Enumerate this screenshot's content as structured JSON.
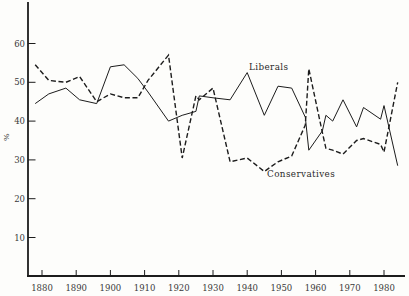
{
  "figure": {
    "background": "#fdfdfb",
    "line_color": "#1c1c1c",
    "text_color": "#3a3a3a"
  },
  "labels": {
    "y_unit": "%",
    "liberals": "Liberals",
    "conservatives": "Conservatives"
  },
  "chart_data": {
    "type": "line",
    "title": "",
    "xlabel": "",
    "ylabel": "%",
    "grid": false,
    "legend": "inline-annotations",
    "xlim": [
      1876,
      1986
    ],
    "ylim": [
      0,
      63
    ],
    "x_ticks": [
      1880,
      1890,
      1900,
      1910,
      1920,
      1930,
      1940,
      1950,
      1960,
      1970,
      1980
    ],
    "y_ticks": [
      10,
      20,
      30,
      40,
      50,
      60
    ],
    "series": [
      {
        "name": "Liberals",
        "style": "solid",
        "x": [
          1878,
          1882,
          1887,
          1891,
          1896,
          1900,
          1904,
          1908,
          1911,
          1917,
          1921,
          1925,
          1926,
          1930,
          1935,
          1940,
          1945,
          1949,
          1953,
          1957,
          1958,
          1962,
          1963,
          1965,
          1968,
          1972,
          1974,
          1979,
          1980,
          1984
        ],
        "values": [
          44.5,
          47,
          48.5,
          45.5,
          44.5,
          54,
          54.5,
          51,
          47.5,
          40,
          41.5,
          42.5,
          46.5,
          46,
          45.5,
          52.5,
          41.5,
          49,
          48.5,
          41,
          32.5,
          37.5,
          41.5,
          40,
          45.5,
          38.5,
          43.5,
          40.5,
          44,
          28.5
        ]
      },
      {
        "name": "Conservatives",
        "style": "dashed",
        "x": [
          1878,
          1882,
          1887,
          1891,
          1896,
          1900,
          1904,
          1908,
          1911,
          1917,
          1921,
          1925,
          1926,
          1930,
          1935,
          1940,
          1945,
          1949,
          1953,
          1957,
          1958,
          1962,
          1963,
          1965,
          1968,
          1972,
          1974,
          1979,
          1980,
          1984
        ],
        "values": [
          54.5,
          50.5,
          50,
          51.5,
          45,
          47,
          46,
          46,
          50.5,
          57,
          30.5,
          46.5,
          45.5,
          48.5,
          29.5,
          30.5,
          27,
          29.5,
          31,
          39,
          53.5,
          37,
          33,
          32.5,
          31.5,
          35,
          35.5,
          34,
          32,
          50
        ]
      }
    ]
  }
}
